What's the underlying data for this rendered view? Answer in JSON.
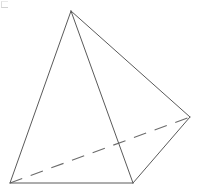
{
  "figure": {
    "canvas": {
      "width": 199,
      "height": 194,
      "background": "#ffffff"
    },
    "style": {
      "solid_edge_color": "#5a5a5a",
      "hidden_edge_color": "#6b6b6b",
      "face_color": "#ffffff",
      "solid_edge_width": 1,
      "hidden_edge_width": 1.1,
      "hidden_dash_pattern": "13 9"
    },
    "vertices": [
      {
        "id": "apex",
        "label": "apex",
        "x": 71,
        "y": 11
      },
      {
        "id": "base-left",
        "label": "base left",
        "x": 10,
        "y": 183
      },
      {
        "id": "base-front",
        "label": "base front",
        "x": 133,
        "y": 183
      },
      {
        "id": "base-right",
        "label": "base right",
        "x": 190,
        "y": 117
      }
    ],
    "edges": [
      {
        "id": "apex-to-base-left",
        "from": "apex",
        "to": "base-left",
        "visibility": "visible",
        "style": "solid"
      },
      {
        "id": "apex-to-base-front",
        "from": "apex",
        "to": "base-front",
        "visibility": "visible",
        "style": "solid"
      },
      {
        "id": "apex-to-base-right",
        "from": "apex",
        "to": "base-right",
        "visibility": "visible",
        "style": "solid"
      },
      {
        "id": "base-left-to-base-front",
        "from": "base-left",
        "to": "base-front",
        "visibility": "visible",
        "style": "solid"
      },
      {
        "id": "base-front-to-base-right",
        "from": "base-front",
        "to": "base-right",
        "visibility": "visible",
        "style": "solid"
      },
      {
        "id": "base-left-to-base-right",
        "from": "base-left",
        "to": "base-right",
        "visibility": "hidden",
        "style": "dashed"
      }
    ],
    "faces": [
      {
        "id": "face-front-left",
        "vertices": "apex base-left base-front"
      },
      {
        "id": "face-front-right",
        "vertices": "apex base-front base-right"
      }
    ],
    "corner_mark": {
      "id": "corner-artifact",
      "label": "faint corner artifact"
    }
  }
}
